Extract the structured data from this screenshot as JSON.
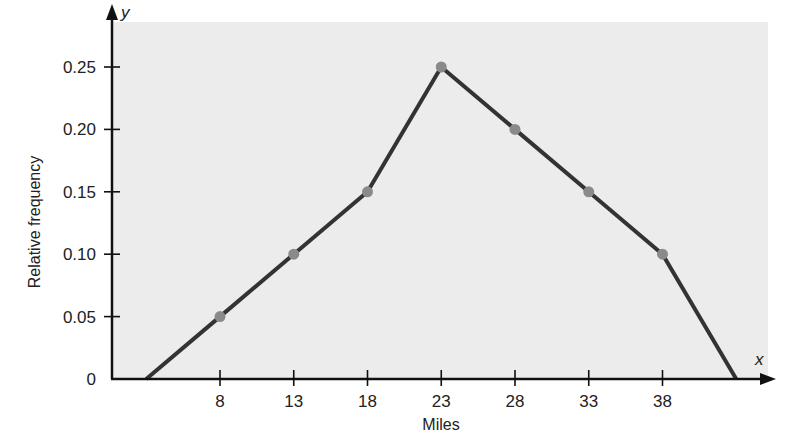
{
  "chart_data": {
    "type": "line",
    "title": "",
    "xlabel": "Miles",
    "ylabel": "Relative frequency",
    "x_axis_var": "x",
    "y_axis_var": "y",
    "x_ticks": [
      8,
      13,
      18,
      23,
      28,
      33,
      38
    ],
    "y_ticks": [
      "0",
      "0.05",
      "0.10",
      "0.15",
      "0.20",
      "0.25"
    ],
    "ylim": [
      0,
      0.28
    ],
    "xlim": [
      1,
      45
    ],
    "grid": false,
    "legend": null,
    "background_color": "#ececec",
    "line_color": "#333333",
    "marker_color": "#8a8a8a",
    "series": [
      {
        "name": "Relative frequency polygon",
        "x": [
          3,
          8,
          13,
          18,
          23,
          28,
          33,
          38,
          43
        ],
        "values": [
          0,
          0.05,
          0.1,
          0.15,
          0.25,
          0.2,
          0.15,
          0.1,
          0
        ],
        "markers_at": [
          8,
          13,
          18,
          23,
          28,
          33,
          38
        ]
      }
    ]
  }
}
